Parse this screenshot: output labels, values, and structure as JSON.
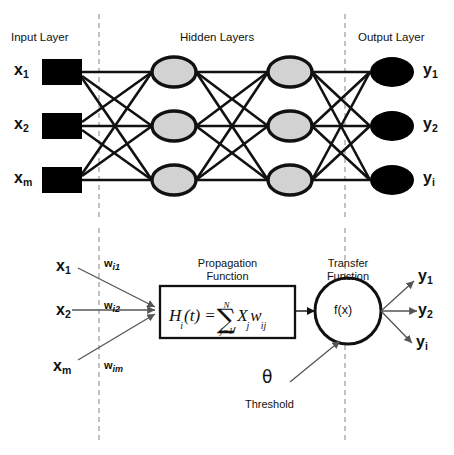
{
  "figure": {
    "colors": {
      "line": "#111111",
      "input_node_fill": "#000000",
      "hidden_node_fill": "#d2d2d2",
      "output_node_fill": "#000000",
      "divider": "#999999",
      "background": "#ffffff"
    }
  },
  "network": {
    "layer_titles": {
      "input": "Input Layer",
      "hidden": "Hidden Layers",
      "output": "Output Layer"
    },
    "input_labels": [
      "x",
      "x",
      "x"
    ],
    "input_subs": [
      "1",
      "2",
      "m"
    ],
    "output_labels": [
      "y",
      "y",
      "y"
    ],
    "output_subs": [
      "1",
      "2",
      "i"
    ],
    "layer_sizes": [
      3,
      3,
      3,
      3
    ],
    "connectivity": "fully-connected"
  },
  "neuron": {
    "inputs": [
      {
        "var": "x",
        "sub": "1",
        "weight": "w",
        "weight_sub": "i1"
      },
      {
        "var": "x",
        "sub": "2",
        "weight": "w",
        "weight_sub": "i2"
      },
      {
        "var": "x",
        "sub": "m",
        "weight": "w",
        "weight_sub": "im"
      }
    ],
    "propagation": {
      "title_line1": "Propagation",
      "title_line2": "Function",
      "formula_lhs": "H",
      "formula_lhs_sub": "i",
      "formula_arg": "(t) =",
      "sum_upper": "N",
      "sum_symbol": "∑",
      "sum_lower": "j=1",
      "formula_term1": "X",
      "formula_term1_sub": "j",
      "formula_term2": "w",
      "formula_term2_sub": "ij"
    },
    "transfer": {
      "title_line1": "Transfer",
      "title_line2": "Function",
      "body": "f(x)"
    },
    "threshold": {
      "symbol": "θ",
      "label": "Threshold"
    },
    "outputs": [
      {
        "var": "y",
        "sub": "1"
      },
      {
        "var": "y",
        "sub": "2"
      },
      {
        "var": "y",
        "sub": "i"
      }
    ]
  }
}
